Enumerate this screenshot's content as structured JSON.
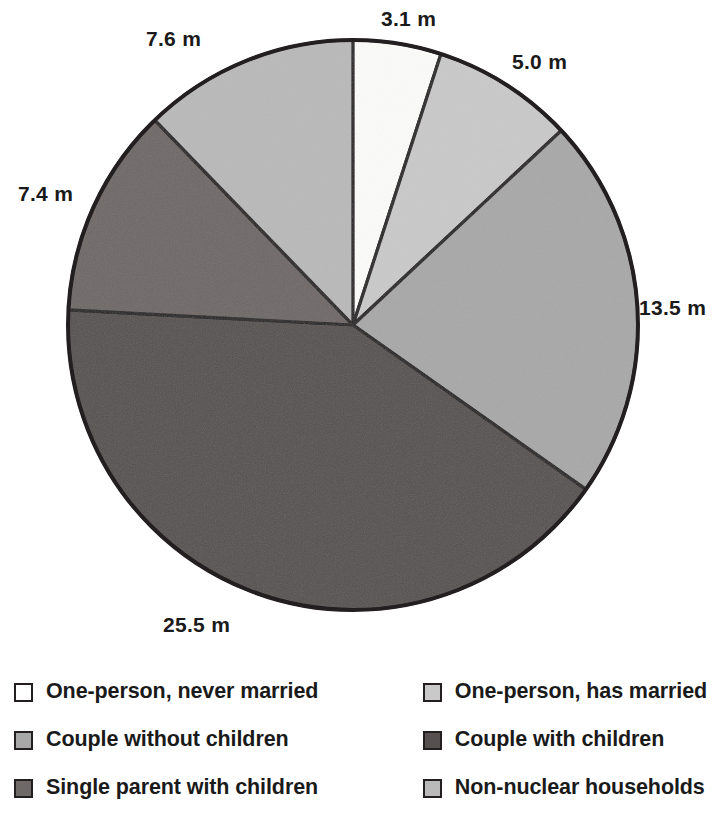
{
  "chart_data": {
    "type": "pie",
    "title": "",
    "subtitle": "",
    "unit_suffix": " m",
    "total": 62.1,
    "start_angle_deg": 0,
    "direction": "clockwise",
    "legend_position": "bottom",
    "grid": false,
    "categories": [
      "One-person, never married",
      "One-person, has married",
      "Couple without children",
      "Couple with children",
      "Single parent with children",
      "Non-nuclear households"
    ],
    "values": [
      3.1,
      5.0,
      13.5,
      25.5,
      7.4,
      7.6
    ],
    "data_labels": [
      "3.1 m",
      "5.0 m",
      "13.5 m",
      "25.5 m",
      "7.4 m",
      "7.6 m"
    ],
    "colors": [
      "#fbfbf9",
      "#c9c9c9",
      "#a8a8a8",
      "#565150",
      "#6e6866",
      "#b9b9b9"
    ],
    "slice_border_color": "#231f20",
    "slices": [
      {
        "label": "One-person, never married",
        "value": 3.1,
        "data_label": "3.1 m",
        "color": "#fbfbf9",
        "start_deg": 0.0,
        "end_deg": 17.97
      },
      {
        "label": "One-person, has married",
        "value": 5.0,
        "data_label": "5.0 m",
        "color": "#c9c9c9",
        "start_deg": 17.97,
        "end_deg": 46.96
      },
      {
        "label": "Couple without children",
        "value": 13.5,
        "data_label": "13.5 m",
        "color": "#a8a8a8",
        "start_deg": 46.96,
        "end_deg": 125.22
      },
      {
        "label": "Couple with children",
        "value": 25.5,
        "data_label": "25.5 m",
        "color": "#565150",
        "start_deg": 125.22,
        "end_deg": 273.04
      },
      {
        "label": "Single parent with children",
        "value": 7.4,
        "data_label": "7.4 m",
        "color": "#6e6866",
        "start_deg": 273.04,
        "end_deg": 315.94
      },
      {
        "label": "Non-nuclear households",
        "value": 7.6,
        "data_label": "7.6 m",
        "color": "#b9b9b9",
        "start_deg": 315.94,
        "end_deg": 360.0
      }
    ]
  },
  "pie": {
    "center_x": 353,
    "center_y": 325,
    "radius": 285,
    "outline_color": "#231f20",
    "labels": [
      {
        "text": "3.1 m",
        "x": 381,
        "y": 8,
        "align": "left"
      },
      {
        "text": "5.0 m",
        "x": 512,
        "y": 51,
        "align": "left"
      },
      {
        "text": "13.5 m",
        "x": 639,
        "y": 297,
        "align": "left"
      },
      {
        "text": "25.5 m",
        "x": 163,
        "y": 614,
        "align": "left"
      },
      {
        "text": "7.4 m",
        "x": 18,
        "y": 183,
        "align": "left"
      },
      {
        "text": "7.6 m",
        "x": 146,
        "y": 28,
        "align": "left"
      }
    ]
  },
  "legend": {
    "rows": [
      {
        "left": {
          "label": "One-person, never married",
          "color": "#ffffff"
        },
        "right": {
          "label": "One-person, has married",
          "color": "#c9c9c9"
        }
      },
      {
        "left": {
          "label": "Couple without children",
          "color": "#a8a8a8"
        },
        "right": {
          "label": "Couple with children",
          "color": "#565150"
        }
      },
      {
        "left": {
          "label": "Single parent with children",
          "color": "#6e6866"
        },
        "right": {
          "label": "Non-nuclear households",
          "color": "#b9b9b9"
        }
      }
    ]
  }
}
